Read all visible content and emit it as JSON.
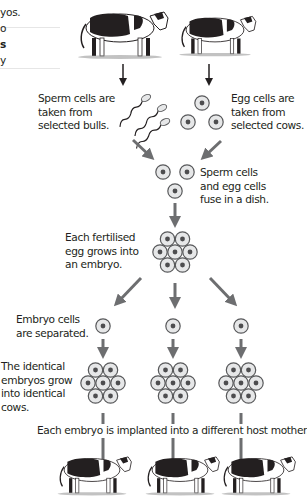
{
  "left_margin_fragments": [
    "yos.",
    "o",
    "s",
    "y"
  ],
  "labels": {
    "sperm": [
      "Sperm cells are",
      "taken from",
      "selected bulls."
    ],
    "egg": [
      "Egg cells are",
      "taken from",
      "selected cows."
    ],
    "fuse": [
      "Sperm cells",
      "and egg cells",
      "fuse in a dish."
    ],
    "embryo": [
      "Each fertilised",
      "egg grows into",
      "an embryo."
    ],
    "separated": [
      "Embryo cells",
      "are separated."
    ],
    "identical": [
      "The identical",
      "embryos grow",
      "into identical",
      "cows."
    ],
    "implant": "Each embryo is implanted into a different host mother."
  },
  "colors": {
    "arrow_black": "#231f20",
    "arrow_grey": "#6d6e70",
    "cell_fill": "#e6e7e8",
    "cell_stroke": "#58595b",
    "nucleus": "#4d4d4f"
  }
}
